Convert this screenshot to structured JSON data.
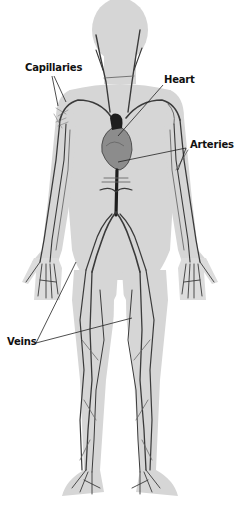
{
  "diagram": {
    "labels": {
      "capillaries": "Capillaries",
      "heart": "Heart",
      "arteries": "Arteries",
      "veins": "Veins"
    },
    "colors": {
      "background": "#ffffff",
      "body": "#d6d6d6",
      "vessels": "#2a2a2a",
      "label_text": "#111111"
    }
  }
}
